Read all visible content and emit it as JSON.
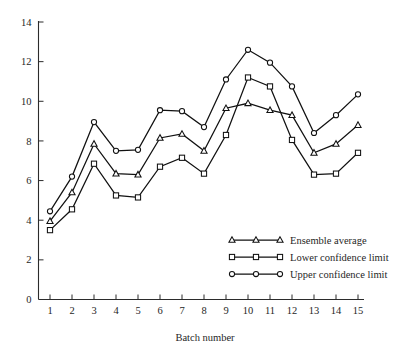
{
  "chart_data": {
    "type": "line",
    "title": "",
    "xlabel": "Batch number",
    "ylabel": "",
    "categories": [
      1,
      2,
      3,
      4,
      5,
      6,
      7,
      8,
      9,
      10,
      11,
      12,
      13,
      14,
      15
    ],
    "x": [
      1,
      2,
      3,
      4,
      5,
      6,
      7,
      8,
      9,
      10,
      11,
      12,
      13,
      14,
      15
    ],
    "xlim": [
      0,
      15.6
    ],
    "ylim": [
      0,
      14
    ],
    "xticks": [
      1,
      2,
      3,
      4,
      5,
      6,
      7,
      8,
      9,
      10,
      11,
      12,
      13,
      14,
      15
    ],
    "yticks": [
      0,
      2,
      4,
      6,
      8,
      10,
      12,
      14
    ],
    "xtick_labels": [
      "1",
      "2",
      "3",
      "4",
      "5",
      "6",
      "7",
      "8",
      "9",
      "10",
      "11",
      "12",
      "13",
      "14",
      "15"
    ],
    "ytick_labels": [
      "0",
      "2",
      "4",
      "6",
      "8",
      "10",
      "12",
      "14"
    ],
    "grid": false,
    "legend_position": "inside-lower-right",
    "series": [
      {
        "name": "Ensemble average",
        "marker": "triangle",
        "values": [
          3.95,
          5.4,
          7.85,
          6.35,
          6.3,
          8.15,
          8.35,
          7.5,
          9.65,
          9.9,
          9.55,
          9.3,
          7.4,
          7.85,
          8.8
        ]
      },
      {
        "name": "Lower confidence limit",
        "marker": "square",
        "values": [
          3.5,
          4.55,
          6.85,
          5.25,
          5.15,
          6.7,
          7.15,
          6.35,
          8.3,
          11.2,
          10.75,
          8.05,
          6.3,
          6.35,
          7.4
        ]
      },
      {
        "name": "Upper confidence limit",
        "marker": "circle",
        "values": [
          4.45,
          6.2,
          8.95,
          7.5,
          7.55,
          9.55,
          9.5,
          8.7,
          11.1,
          12.6,
          11.95,
          10.75,
          8.4,
          9.3,
          10.35
        ]
      }
    ]
  },
  "legend": {
    "entries": [
      {
        "label": "Ensemble average",
        "marker": "triangle-icon"
      },
      {
        "label": "Lower confidence limit",
        "marker": "square-icon"
      },
      {
        "label": "Upper confidence limit",
        "marker": "circle-icon"
      }
    ]
  },
  "colors": {
    "line": "#111111",
    "axis": "#2b2b2b",
    "marker_fill": "#ffffff",
    "background": "#ffffff",
    "text": "#1f1f1f"
  }
}
